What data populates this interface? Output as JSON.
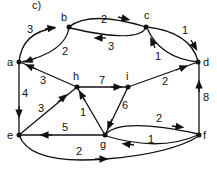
{
  "figure": {
    "caption": "c)",
    "nodes": [
      {
        "id": "a",
        "label": "a"
      },
      {
        "id": "b",
        "label": "b"
      },
      {
        "id": "c",
        "label": "c"
      },
      {
        "id": "d",
        "label": "d"
      },
      {
        "id": "e",
        "label": "e"
      },
      {
        "id": "f",
        "label": "f"
      },
      {
        "id": "g",
        "label": "g"
      },
      {
        "id": "h",
        "label": "h"
      },
      {
        "id": "i",
        "label": "i"
      }
    ],
    "edges": [
      {
        "from": "a",
        "to": "b",
        "weight": "3"
      },
      {
        "from": "b",
        "to": "a",
        "weight": "2"
      },
      {
        "from": "b",
        "to": "c",
        "weight": "2"
      },
      {
        "from": "c",
        "to": "b",
        "weight": "3"
      },
      {
        "from": "c",
        "to": "d",
        "weight": "1"
      },
      {
        "from": "d",
        "to": "c",
        "weight": "1"
      },
      {
        "from": "a",
        "to": "e",
        "weight": "4"
      },
      {
        "from": "h",
        "to": "a",
        "weight": "3"
      },
      {
        "from": "h",
        "to": "i",
        "weight": "7"
      },
      {
        "from": "i",
        "to": "d",
        "weight": "2"
      },
      {
        "from": "e",
        "to": "h",
        "weight": "3"
      },
      {
        "from": "g",
        "to": "h",
        "weight": "1"
      },
      {
        "from": "i",
        "to": "g",
        "weight": "6"
      },
      {
        "from": "g",
        "to": "e",
        "weight": "5"
      },
      {
        "from": "g",
        "to": "f",
        "weight": "2"
      },
      {
        "from": "f",
        "to": "g",
        "weight": "1"
      },
      {
        "from": "f",
        "to": "d",
        "weight": "8"
      },
      {
        "from": "e",
        "to": "f",
        "weight": "2"
      }
    ]
  }
}
